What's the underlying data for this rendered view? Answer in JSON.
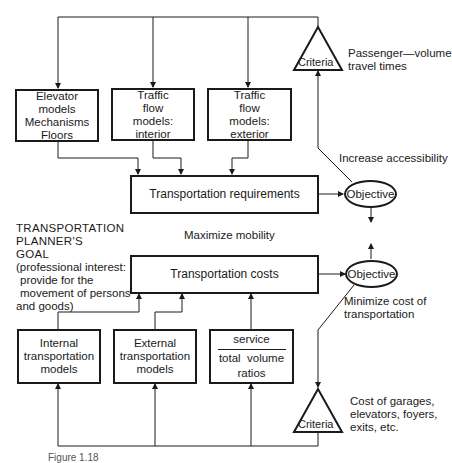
{
  "diagram": {
    "top_boxes": [
      {
        "lines": [
          "Elevator",
          "models",
          "Mechanisms",
          "Floors"
        ]
      },
      {
        "lines": [
          "Traffic",
          "flow",
          "models:",
          "interior"
        ]
      },
      {
        "lines": [
          "Traffic",
          "flow",
          "models:",
          "exterior"
        ]
      }
    ],
    "requirements_box": "Transportation requirements",
    "costs_box": "Transportation costs",
    "objective_top": "Objective",
    "objective_bottom": "Objective",
    "criteria_top": "Criteria",
    "criteria_bottom": "Criteria",
    "criteria_top_note": [
      "Passenger—volume",
      "travel times"
    ],
    "criteria_bottom_note": [
      "Cost of garages,",
      "elevators, foyers,",
      "exits, etc."
    ],
    "objective_top_note": "Increase accessibility",
    "center_note": "Maximize mobility",
    "objective_bottom_note": [
      "Minimize cost of",
      "transportation"
    ],
    "goal": {
      "title_lines": [
        "TRANSPORTATION",
        "PLANNER'S",
        "GOAL"
      ],
      "detail_lines": [
        "(professional interest:",
        "provide for the",
        "movement of persons",
        "and goods)"
      ]
    },
    "bottom_boxes": [
      {
        "lines": [
          "Internal",
          "transportation",
          "models"
        ]
      },
      {
        "lines": [
          "External",
          "transportation",
          "models"
        ]
      },
      {
        "numerator": "service",
        "denominator": "total  volume",
        "suffix": "ratios"
      }
    ],
    "caption": "Figure 1.18"
  }
}
